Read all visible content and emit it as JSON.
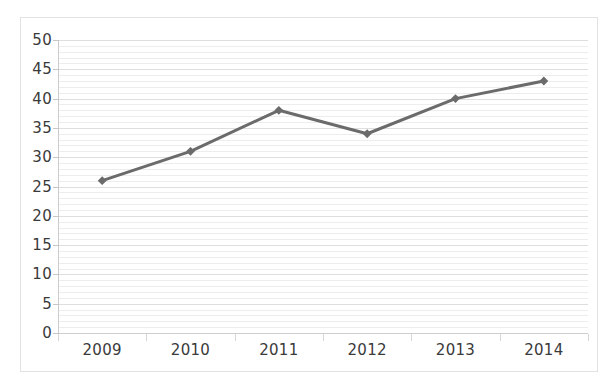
{
  "chart_data": {
    "type": "line",
    "title": "",
    "subtitle": "",
    "xlabel": "",
    "ylabel": "",
    "categories": [
      "2009",
      "2010",
      "2011",
      "2012",
      "2013",
      "2014"
    ],
    "values": [
      26,
      31,
      38,
      34,
      40,
      43
    ],
    "series": [
      {
        "name": "Series 1",
        "values": [
          26,
          31,
          38,
          34,
          40,
          43
        ]
      }
    ],
    "ylim": [
      0,
      50
    ],
    "y_ticks": [
      0,
      5,
      10,
      15,
      20,
      25,
      30,
      35,
      40,
      45,
      50
    ],
    "y_tick_labels": [
      "0",
      "5",
      "10",
      "15",
      "20",
      "25",
      "30",
      "35",
      "40",
      "45",
      "50"
    ],
    "y_minor_step": 1,
    "grid": true,
    "grid_axis": "y",
    "legend": false,
    "legend_position": "none",
    "marker": "diamond",
    "annotations": []
  },
  "style": {
    "series_color": "#6b6b6b",
    "marker_color": "#6b6b6b",
    "gridline_minor_color": "#ededed",
    "gridline_major_color": "#dedede",
    "axis_color": "#cccccc",
    "frame_color": "#e2e2e2",
    "label_color": "#3a3a3a",
    "background_color": "#ffffff"
  }
}
